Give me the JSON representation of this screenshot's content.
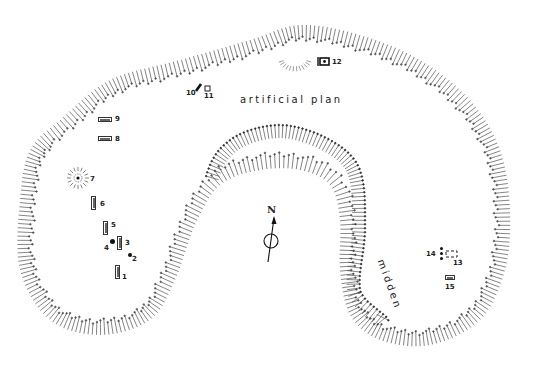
{
  "diagram": {
    "type": "archaeological-site-plan",
    "labels": {
      "artificial_plan": "artificial plan",
      "midden": "midden",
      "north": "N"
    },
    "features": [
      {
        "id": "1",
        "label": "1",
        "kind": "rectangle"
      },
      {
        "id": "2",
        "label": "2",
        "kind": "post-hole"
      },
      {
        "id": "3",
        "label": "3",
        "kind": "rectangle"
      },
      {
        "id": "4",
        "label": "4",
        "kind": "post-hole"
      },
      {
        "id": "5",
        "label": "5",
        "kind": "rectangle"
      },
      {
        "id": "6",
        "label": "6",
        "kind": "rectangle"
      },
      {
        "id": "7",
        "label": "7",
        "kind": "circular-mound"
      },
      {
        "id": "8",
        "label": "8",
        "kind": "rectangle"
      },
      {
        "id": "9",
        "label": "9",
        "kind": "rectangle"
      },
      {
        "id": "10",
        "label": "10",
        "kind": "slab"
      },
      {
        "id": "11",
        "label": "11",
        "kind": "square"
      },
      {
        "id": "12",
        "label": "12",
        "kind": "structure"
      },
      {
        "id": "13",
        "label": "13",
        "kind": "dashed-rectangle"
      },
      {
        "id": "14",
        "label": "14",
        "kind": "post-holes"
      },
      {
        "id": "15",
        "label": "15",
        "kind": "rectangle"
      }
    ],
    "colors": {
      "ink": "#222222",
      "paper": "#ffffff"
    }
  }
}
